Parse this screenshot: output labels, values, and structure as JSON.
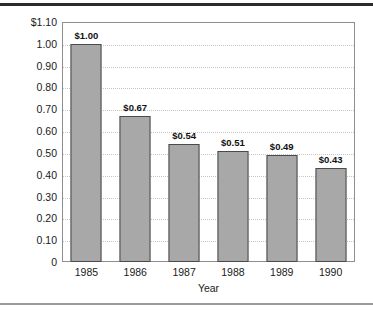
{
  "chart_data": {
    "type": "bar",
    "title": "",
    "xlabel": "Year",
    "ylabel": "",
    "categories": [
      "1985",
      "1986",
      "1987",
      "1988",
      "1989",
      "1990"
    ],
    "values": [
      1.0,
      0.67,
      0.54,
      0.51,
      0.49,
      0.43
    ],
    "data_labels": [
      "$1.00",
      "$0.67",
      "$0.54",
      "$0.51",
      "$0.49",
      "$0.43"
    ],
    "ylim": [
      0,
      1.1
    ],
    "y_ticks": [
      1.1,
      1.0,
      0.9,
      0.8,
      0.7,
      0.6,
      0.5,
      0.4,
      0.3,
      0.2,
      0.1,
      0
    ],
    "y_tick_labels": [
      "$1.10",
      "1.00",
      "0.90",
      "0.80",
      "0.70",
      "0.60",
      "0.50",
      "0.40",
      "0.30",
      "0.20",
      "0.10",
      "0"
    ],
    "grid": true,
    "grid_style": "dotted",
    "legend": false,
    "legend_position": "none",
    "colors": {
      "bar_fill": "#a8a8a8",
      "bar_border": "#4a4a4a",
      "gridline": "#c6c6c6",
      "frame": "#8e8e8e",
      "text": "#1a1a1a",
      "rule_top": "#2b2b2b",
      "rule_bottom": "#9a9a9a",
      "background": "#ffffff"
    }
  }
}
